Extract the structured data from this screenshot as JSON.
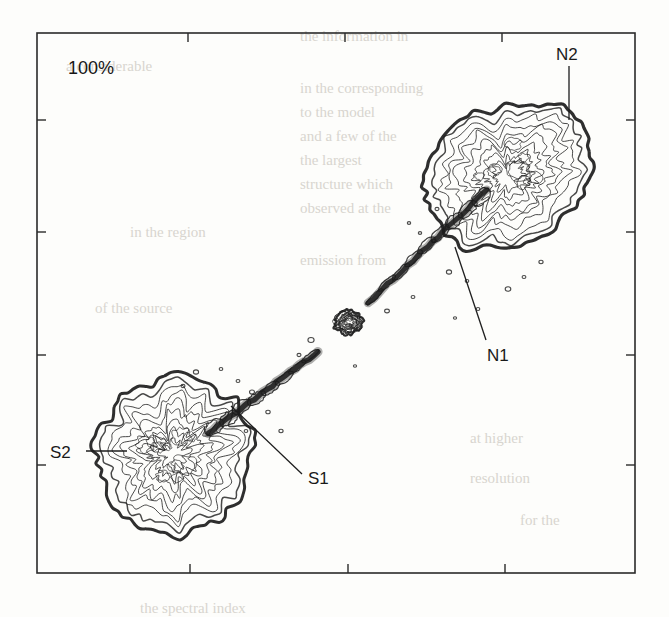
{
  "figure": {
    "kind": "radio-contour-map",
    "background": "#fdfdfb",
    "ink_color": "#1c1c1c",
    "frame": {
      "x": 37,
      "y": 33,
      "width": 598,
      "height": 540,
      "stroke": "#2a2a2a",
      "stroke_width": 1.6
    },
    "scale_label": {
      "text": "100%",
      "x": 68,
      "y": 74
    },
    "annotations": [
      {
        "id": "N2",
        "text": "N2",
        "x": 556,
        "y": 60,
        "leader": {
          "x1": 569,
          "y1": 66,
          "x2": 569,
          "y2": 120
        }
      },
      {
        "id": "N1",
        "text": "N1",
        "x": 487,
        "y": 361,
        "leader": {
          "x1": 455,
          "y1": 247,
          "x2": 486,
          "y2": 340
        }
      },
      {
        "id": "S1",
        "text": "S1",
        "x": 308,
        "y": 484,
        "leader": {
          "x1": 231,
          "y1": 406,
          "x2": 302,
          "y2": 474
        }
      },
      {
        "id": "S2",
        "text": "S2",
        "x": 50,
        "y": 458,
        "leader": {
          "x1": 86,
          "y1": 451,
          "x2": 127,
          "y2": 451
        }
      }
    ],
    "axes": {
      "tick_length": 9,
      "top_ticks_x": [
        188,
        345,
        502
      ],
      "bottom_ticks_x": [
        190,
        348,
        505
      ],
      "left_ticks_y": [
        120,
        232,
        355,
        465
      ],
      "right_ticks_y": [
        120,
        232,
        355,
        465
      ],
      "tick_labels": []
    }
  },
  "chart_data": {
    "type": "contour",
    "title": "",
    "xlabel": "",
    "ylabel": "",
    "grid": false,
    "legend": "none",
    "peak_label": "100%",
    "contour_levels_percent": [
      1,
      2,
      4,
      8,
      16,
      32,
      64,
      100
    ],
    "axis_extent_px": {
      "x": [
        37,
        635
      ],
      "y": [
        33,
        573
      ]
    },
    "components": [
      {
        "name": "north-lobe",
        "label": "N2",
        "center": [
          508,
          175
        ],
        "radius": [
          88,
          68
        ],
        "angle": -28,
        "n_contours": 9,
        "roughness": 0.115,
        "seed": 17,
        "peak_percent": 100,
        "edge_weight": 3.2
      },
      {
        "name": "south-lobe",
        "label": "S2",
        "center": [
          172,
          455
        ],
        "radius": [
          78,
          80
        ],
        "angle": 14,
        "n_contours": 9,
        "roughness": 0.125,
        "seed": 43,
        "peak_percent": 92,
        "edge_weight": 3.0
      },
      {
        "name": "core",
        "label": "nucleus",
        "center": [
          348,
          322
        ],
        "radius": [
          13,
          12
        ],
        "angle": 0,
        "n_contours": 4,
        "roughness": 0.22,
        "seed": 7,
        "peak_percent": 70,
        "edge_weight": 2.2
      }
    ],
    "jets": [
      {
        "name": "north-jet",
        "from": [
          368,
          303
        ],
        "to": [
          487,
          190
        ],
        "width_start": 4.5,
        "width_end": 12,
        "knots": 9,
        "seed": 5
      },
      {
        "name": "south-jet",
        "from": [
          318,
          352
        ],
        "to": [
          208,
          433
        ],
        "width_start": 4.0,
        "width_end": 13,
        "knots": 8,
        "seed": 23
      }
    ],
    "speckles": [
      [
        387,
        311,
        2.4
      ],
      [
        413,
        297,
        1.9
      ],
      [
        311,
        340,
        3.1
      ],
      [
        299,
        355,
        2.0
      ],
      [
        449,
        272,
        2.6
      ],
      [
        467,
        281,
        1.8
      ],
      [
        434,
        241,
        2.2
      ],
      [
        420,
        233,
        1.7
      ],
      [
        508,
        289,
        2.8
      ],
      [
        524,
        277,
        1.9
      ],
      [
        541,
        262,
        2.1
      ],
      [
        478,
        309,
        1.8
      ],
      [
        252,
        392,
        2.5
      ],
      [
        238,
        381,
        1.9
      ],
      [
        268,
        412,
        2.2
      ],
      [
        221,
        369,
        1.8
      ],
      [
        196,
        372,
        2.6
      ],
      [
        183,
        386,
        2.0
      ],
      [
        246,
        431,
        1.8
      ],
      [
        281,
        431,
        2.1
      ],
      [
        437,
        209,
        2.0
      ],
      [
        409,
        223,
        1.7
      ],
      [
        455,
        318,
        1.6
      ],
      [
        355,
        366,
        1.6
      ]
    ],
    "background_text_bleed": [
      {
        "text": "the information in",
        "x": 300,
        "y": 28
      },
      {
        "text": "a considerable",
        "x": 66,
        "y": 58
      },
      {
        "text": "in the corresponding",
        "x": 300,
        "y": 80
      },
      {
        "text": "to the model",
        "x": 300,
        "y": 104
      },
      {
        "text": "and a few of the",
        "x": 300,
        "y": 128
      },
      {
        "text": "the largest",
        "x": 300,
        "y": 152
      },
      {
        "text": "structure which",
        "x": 300,
        "y": 176
      },
      {
        "text": "observed at the",
        "x": 300,
        "y": 200
      },
      {
        "text": "in the region",
        "x": 130,
        "y": 224
      },
      {
        "text": "emission from",
        "x": 300,
        "y": 252
      },
      {
        "text": "of the source",
        "x": 95,
        "y": 300
      },
      {
        "text": "at higher",
        "x": 470,
        "y": 430
      },
      {
        "text": "resolution",
        "x": 470,
        "y": 470
      },
      {
        "text": "for the",
        "x": 520,
        "y": 512
      },
      {
        "text": "the spectral index",
        "x": 140,
        "y": 600
      }
    ]
  }
}
